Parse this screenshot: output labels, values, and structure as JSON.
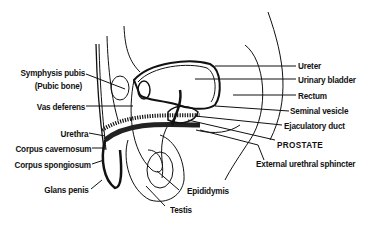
{
  "diagram": {
    "type": "anatomical-illustration",
    "labels_left": [
      {
        "id": "symphysis",
        "text": "Symphysis pubis"
      },
      {
        "id": "pubic",
        "text": "(Pubic bone)"
      },
      {
        "id": "vas",
        "text": "Vas deferens"
      },
      {
        "id": "urethra",
        "text": "Urethra"
      },
      {
        "id": "cavernosum",
        "text": "Corpus cavernosum"
      },
      {
        "id": "spongiosum",
        "text": "Corpus spongiosum"
      },
      {
        "id": "glans",
        "text": "Glans penis"
      }
    ],
    "labels_right": [
      {
        "id": "ureter",
        "text": "Ureter"
      },
      {
        "id": "bladder",
        "text": "Urinary bladder"
      },
      {
        "id": "rectum",
        "text": "Rectum"
      },
      {
        "id": "seminal",
        "text": "Seminal vesicle"
      },
      {
        "id": "ejaculatory",
        "text": "Ejaculatory duct"
      },
      {
        "id": "prostate",
        "text": "PROSTATE"
      },
      {
        "id": "sphincter",
        "text": "External urethral sphincter"
      }
    ],
    "labels_bottom": [
      {
        "id": "epididymis",
        "text": "Epididymis"
      },
      {
        "id": "testis",
        "text": "Testis"
      }
    ],
    "colors": {
      "ink": "#111111",
      "background": "#ffffff"
    }
  }
}
